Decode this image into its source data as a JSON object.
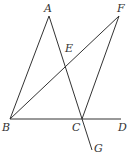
{
  "diagram": {
    "points": {
      "A": {
        "label": "A",
        "x": 49,
        "y": 16,
        "lx": 44,
        "ly": 12
      },
      "F": {
        "label": "F",
        "x": 119,
        "y": 16,
        "lx": 117,
        "ly": 12
      },
      "E": {
        "label": "E",
        "x": 66,
        "y": 67,
        "lx": 65,
        "ly": 52
      },
      "B": {
        "label": "B",
        "x": 10,
        "y": 119,
        "lx": 2,
        "ly": 131
      },
      "C": {
        "label": "C",
        "x": 82,
        "y": 119,
        "lx": 72,
        "ly": 131
      },
      "D": {
        "label": "D",
        "x": 121,
        "y": 119,
        "lx": 118,
        "ly": 131
      },
      "G": {
        "label": "G",
        "x": 92,
        "y": 150,
        "lx": 94,
        "ly": 152
      }
    },
    "segments": [
      [
        "A",
        "B"
      ],
      [
        "A",
        "G"
      ],
      [
        "B",
        "F"
      ],
      [
        "F",
        "C"
      ],
      [
        "B",
        "D"
      ]
    ],
    "stroke_color": "#333333"
  }
}
